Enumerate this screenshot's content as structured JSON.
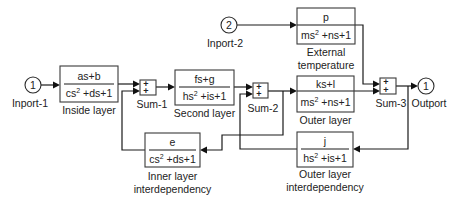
{
  "diagram": {
    "type": "simulink-block-diagram",
    "inports": [
      {
        "id": "inport-1",
        "number": "1",
        "label": "Inport-1"
      },
      {
        "id": "inport-2",
        "number": "2",
        "label": "Inport-2"
      }
    ],
    "outports": [
      {
        "id": "outport",
        "number": "1",
        "label": "Outport"
      }
    ],
    "transfer_blocks": [
      {
        "id": "inside-layer",
        "numerator": "as+b",
        "denominator": {
          "pre": "cs",
          "exp": "2",
          "post": " +ds+1"
        },
        "label": "Inside layer"
      },
      {
        "id": "second-layer",
        "numerator": "fs+g",
        "denominator": {
          "pre": "hs",
          "exp": "2",
          "post": " +is+1"
        },
        "label": "Second layer"
      },
      {
        "id": "external-temperature",
        "numerator": "p",
        "denominator": {
          "pre": "ms",
          "exp": "2",
          "post": " +ns+1"
        },
        "label_lines": [
          "External",
          "temperature"
        ]
      },
      {
        "id": "outer-layer",
        "numerator": "ks+l",
        "denominator": {
          "pre": "ms",
          "exp": "2",
          "post": " +ns+1"
        },
        "label": "Outer layer"
      },
      {
        "id": "inner-layer-interdependency",
        "numerator": "e",
        "denominator": {
          "pre": "cs",
          "exp": "2",
          "post": " +ds+1"
        },
        "label_lines": [
          "Inner layer",
          "interdependency"
        ]
      },
      {
        "id": "outer-layer-interdependency",
        "numerator": "j",
        "denominator": {
          "pre": "hs",
          "exp": "2",
          "post": " +is+1"
        },
        "label_lines": [
          "Outer layer",
          "interdependency"
        ]
      }
    ],
    "sums": [
      {
        "id": "sum-1",
        "label": "Sum-1",
        "signs": [
          "+",
          "+"
        ]
      },
      {
        "id": "sum-2",
        "label": "Sum-2",
        "signs": [
          "+",
          "+"
        ]
      },
      {
        "id": "sum-3",
        "label": "Sum-3",
        "signs": [
          "+",
          "+"
        ]
      }
    ],
    "connections": [
      [
        "Inport-1",
        "Inside layer"
      ],
      [
        "Inside layer",
        "Sum-1 (+1)"
      ],
      [
        "Inner layer interdependency",
        "Sum-1 (+2)"
      ],
      [
        "Sum-1",
        "Second layer"
      ],
      [
        "Second layer",
        "Sum-2 (+1)"
      ],
      [
        "Outer layer interdependency",
        "Sum-2 (+2)"
      ],
      [
        "Sum-2",
        "Outer layer"
      ],
      [
        "Sum-2",
        "Inner layer interdependency"
      ],
      [
        "Inport-2",
        "External temperature"
      ],
      [
        "External temperature",
        "Sum-3 (+1)"
      ],
      [
        "Outer layer",
        "Sum-3 (+2)"
      ],
      [
        "Sum-3",
        "Outport"
      ],
      [
        "Sum-3",
        "Outer layer interdependency"
      ]
    ]
  }
}
